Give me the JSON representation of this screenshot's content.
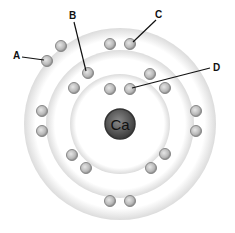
{
  "diagram": {
    "nucleus": {
      "symbol": "Ca",
      "cx": 120,
      "cy": 124
    },
    "labels": [
      {
        "text": "A",
        "x": 13,
        "y": 52
      },
      {
        "text": "B",
        "x": 69,
        "y": 12
      },
      {
        "text": "C",
        "x": 155,
        "y": 11
      },
      {
        "text": "D",
        "x": 212,
        "y": 63
      }
    ],
    "electrons": [
      [
        110,
        89
      ],
      [
        130,
        89
      ],
      [
        74,
        88
      ],
      [
        88,
        73
      ],
      [
        150,
        74
      ],
      [
        165,
        88
      ],
      [
        72,
        155
      ],
      [
        86,
        168
      ],
      [
        151,
        168
      ],
      [
        165,
        154
      ],
      [
        47,
        61
      ],
      [
        61,
        46
      ],
      [
        110,
        44
      ],
      [
        130,
        44
      ],
      [
        196,
        111
      ],
      [
        196,
        131
      ],
      [
        42,
        111
      ],
      [
        42,
        131
      ],
      [
        110,
        201
      ],
      [
        130,
        201
      ]
    ]
  }
}
